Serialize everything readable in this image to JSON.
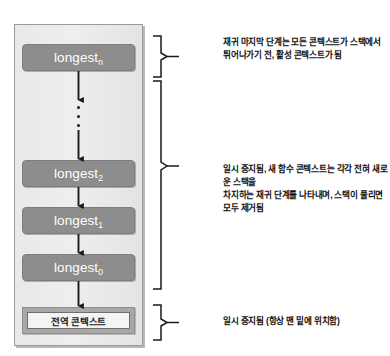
{
  "figure": {
    "stack_panel": {
      "name": "call-stack"
    },
    "frames": [
      {
        "label": "longest",
        "subscript": "n"
      },
      {
        "label": "longest",
        "subscript": "2"
      },
      {
        "label": "longest",
        "subscript": "1"
      },
      {
        "label": "longest",
        "subscript": "0"
      }
    ],
    "global_context": {
      "label": "전역 콘텍스트"
    },
    "ellipsis": "⋮",
    "annotations": [
      {
        "id": "top",
        "text": "재귀 마지막 단계는 모든 콘텍스트가 스택에서\n튀어나가기 전, 활성 콘텍스트가 됨"
      },
      {
        "id": "middle",
        "text": "일시 중지됨, 새 함수 콘텍스트는 각각 전혀 새로운 스택을\n차지하는 재귀 단계를 나타내며, 스택이 풀리면 모두 제거됨"
      },
      {
        "id": "bottom",
        "text": "일시 중지됨 (항상 맨 밑에 위치함)"
      }
    ],
    "colors": {
      "panel_bg": "#ebebeb",
      "panel_border": "#9a9a9a",
      "frame_bg": "#8d8d8d",
      "frame_text": "#ffffff",
      "global_outer": "#a8a8a8",
      "global_inner": "#f4f4f4",
      "ink": "#101010"
    }
  }
}
